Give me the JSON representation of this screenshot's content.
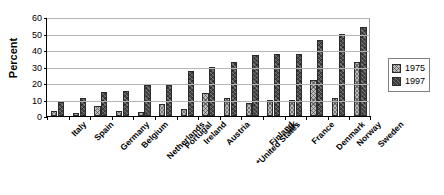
{
  "chart_data": {
    "type": "bar",
    "title": "",
    "xlabel": "",
    "ylabel": "Percent",
    "ylim": [
      0,
      60
    ],
    "yticks": [
      0,
      10,
      20,
      30,
      40,
      50,
      60
    ],
    "grid": true,
    "legend_position": "right",
    "categories": [
      "Italy",
      "Spain",
      "Germany",
      "Belgium",
      "Netherlands",
      "Portugal",
      "Ireland",
      "Austria",
      "*United States",
      "Finland",
      "UK",
      "France",
      "Denmark",
      "Norway",
      "Sweden"
    ],
    "series": [
      {
        "name": "1975",
        "values": [
          3,
          2,
          6,
          3,
          2.5,
          7.5,
          4,
          14,
          11,
          8,
          10,
          9.5,
          22,
          11,
          33
        ]
      },
      {
        "name": "1997",
        "values": [
          8.5,
          11,
          14.5,
          15,
          19,
          19,
          27,
          30,
          33,
          37,
          37.5,
          37.5,
          46,
          50,
          54
        ]
      }
    ]
  },
  "legend": {
    "entries": [
      {
        "label": "1975"
      },
      {
        "label": "1997"
      }
    ]
  },
  "colors": {
    "series_1975": "#bdbdbd",
    "series_1997": "#4a4a4a",
    "axis": "#000000",
    "gridline": "#b5b5b5",
    "background": "#ffffff"
  }
}
